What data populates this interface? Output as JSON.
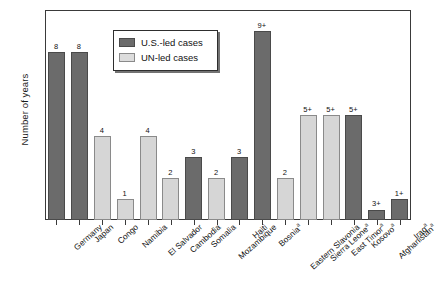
{
  "chart_data": {
    "type": "bar",
    "title": "",
    "xlabel": "",
    "ylabel": "Number of years",
    "ylim": [
      0,
      10
    ],
    "ytick_labels": [
      "0",
      "1",
      "2",
      "3",
      "4",
      "5",
      "6",
      "7",
      "8",
      "9",
      "10"
    ],
    "grid": false,
    "legend_position": "upper-left-inside",
    "categories": [
      "Germany",
      "Japan",
      "Congo",
      "Namibia",
      "El Salvador",
      "Cambodia",
      "Somalia",
      "Mozambique",
      "Haiti",
      "Bosnia",
      "Eastern Slavonia",
      "Sierra Leone",
      "East Timor",
      "Kosovo",
      "Afghanistan",
      "Iraq"
    ],
    "category_superscripts": [
      "",
      "",
      "",
      "",
      "",
      "",
      "",
      "",
      "",
      "a",
      "",
      "a",
      "a",
      "a",
      "a",
      "a"
    ],
    "series": [
      {
        "name": "U.S.-led cases",
        "color": "#6b6b6b"
      },
      {
        "name": "UN-led cases",
        "color": "#d6d6d6"
      }
    ],
    "bars": [
      {
        "category": "Germany",
        "value": 8,
        "label": "8",
        "series": "U.S.-led cases"
      },
      {
        "category": "Japan",
        "value": 8,
        "label": "8",
        "series": "U.S.-led cases"
      },
      {
        "category": "Congo",
        "value": 4,
        "label": "4",
        "series": "UN-led cases"
      },
      {
        "category": "Namibia",
        "value": 1,
        "label": "1",
        "series": "UN-led cases"
      },
      {
        "category": "El Salvador",
        "value": 4,
        "label": "4",
        "series": "UN-led cases"
      },
      {
        "category": "Cambodia",
        "value": 2,
        "label": "2",
        "series": "UN-led cases"
      },
      {
        "category": "Somalia",
        "value": 3,
        "label": "3",
        "series": "U.S.-led cases"
      },
      {
        "category": "Mozambique",
        "value": 2,
        "label": "2",
        "series": "UN-led cases"
      },
      {
        "category": "Haiti",
        "value": 3,
        "label": "3",
        "series": "U.S.-led cases"
      },
      {
        "category": "Bosnia",
        "value": 9,
        "label": "9+",
        "series": "U.S.-led cases"
      },
      {
        "category": "Eastern Slavonia",
        "value": 2,
        "label": "2",
        "series": "UN-led cases"
      },
      {
        "category": "Sierra Leone",
        "value": 5,
        "label": "5+",
        "series": "UN-led cases"
      },
      {
        "category": "East Timor",
        "value": 5,
        "label": "5+",
        "series": "UN-led cases"
      },
      {
        "category": "Kosovo",
        "value": 5,
        "label": "5+",
        "series": "U.S.-led cases"
      },
      {
        "category": "Afghanistan",
        "value": 0.5,
        "label": "3+",
        "series": "U.S.-led cases"
      },
      {
        "category": "Iraq",
        "value": 1,
        "label": "1+",
        "series": "U.S.-led cases"
      }
    ]
  },
  "legend": {
    "items": [
      {
        "label": "U.S.-led cases",
        "color": "#6b6b6b"
      },
      {
        "label": "UN-led cases",
        "color": "#d6d6d6"
      }
    ]
  }
}
